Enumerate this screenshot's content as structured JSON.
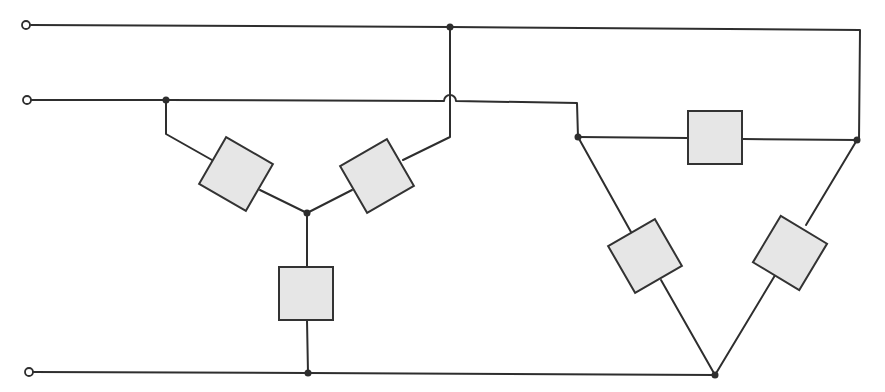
{
  "diagram": {
    "type": "three-phase-circuit",
    "colors": {
      "wire": "#2e2e2e",
      "load_fill": "#e6e6e6",
      "load_stroke": "#333333",
      "background": "#ffffff"
    },
    "supply_lines": [
      {
        "id": "line-1",
        "terminal": [
          28,
          25
        ]
      },
      {
        "id": "line-2",
        "terminal": [
          28,
          100
        ]
      },
      {
        "id": "line-3",
        "terminal": [
          28,
          373
        ]
      }
    ],
    "star_load": {
      "center": [
        307,
        213
      ],
      "impedances": 3
    },
    "delta_load": {
      "vertices": [
        [
          578,
          137
        ],
        [
          857,
          140
        ],
        [
          715,
          375
        ]
      ],
      "impedances": 3
    },
    "labels": []
  }
}
